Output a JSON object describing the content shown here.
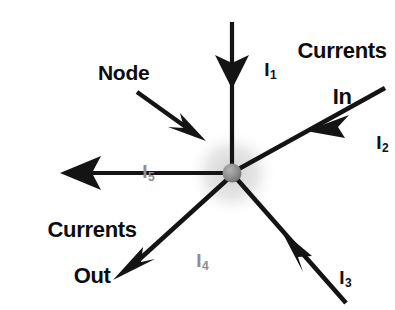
{
  "figure": {
    "background_color": "#ffffff",
    "line_color": "#141414",
    "node_fill_color": "#8f8f8f",
    "node_halo_color": "#d8d8d8",
    "faded_label_color": "#8e8e8e"
  },
  "annotations": {
    "currents_in_line1": "Currents",
    "currents_in_line2": "In",
    "currents_out_line1": "Currents",
    "currents_out_line2": "Out",
    "node_label": "Node"
  },
  "currents": [
    {
      "id": "I1",
      "symbol": "I",
      "subscript": "1",
      "direction": "in",
      "orientation": "from-top",
      "arrow_points_toward_node": true
    },
    {
      "id": "I2",
      "symbol": "I",
      "subscript": "2",
      "direction": "in",
      "orientation": "from-upper-right",
      "arrow_points_toward_node": true
    },
    {
      "id": "I3",
      "symbol": "I",
      "subscript": "3",
      "direction": "in",
      "orientation": "from-lower-right",
      "arrow_points_toward_node": true
    },
    {
      "id": "I4",
      "symbol": "I",
      "subscript": "4",
      "direction": "out",
      "orientation": "to-lower-left",
      "arrow_points_toward_node": false
    },
    {
      "id": "I5",
      "symbol": "I",
      "subscript": "5",
      "direction": "out",
      "orientation": "to-left",
      "arrow_points_toward_node": false
    }
  ]
}
